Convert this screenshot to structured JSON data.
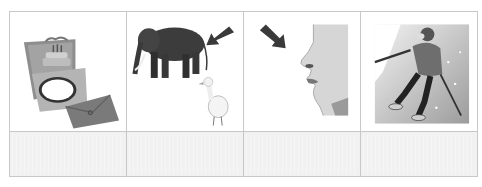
{
  "worksheet": {
    "columns": 4,
    "pictures": [
      {
        "id": "card",
        "icon": "birthday-card-icon",
        "description": "Pop-up greeting card with birthday cake and envelope"
      },
      {
        "id": "elephant",
        "icon": "elephant-duck-icon",
        "description": "Elephant with arrow pointing at its tail, and a duck"
      },
      {
        "id": "nose",
        "icon": "face-nose-icon",
        "description": "Face profile with arrow pointing at the nose"
      },
      {
        "id": "skier",
        "icon": "skier-icon",
        "description": "Person skiing with poles"
      }
    ],
    "answers": [
      "",
      "",
      "",
      ""
    ]
  },
  "colors": {
    "border": "#c8c8c8",
    "answer_fill": "#f1f1f1",
    "arrow": "#3a3a3a"
  }
}
